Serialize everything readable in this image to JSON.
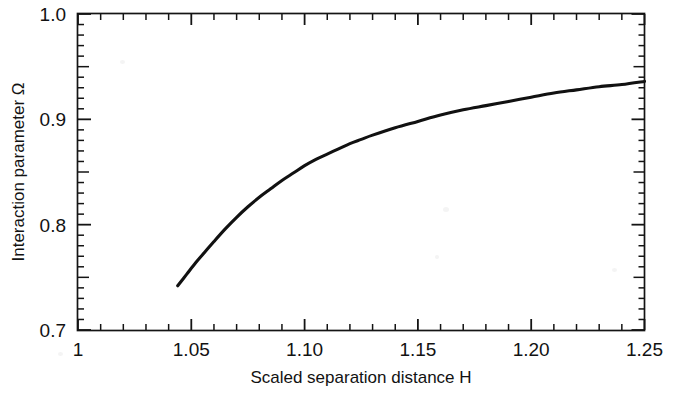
{
  "figure": {
    "background_color": "#ffffff",
    "line_color": "#111111"
  },
  "chart_data": {
    "type": "line",
    "title": "",
    "subtitle": "",
    "xlabel": "Scaled separation distance H",
    "ylabel": "Interaction parameter Ω",
    "xlim": [
      1.0,
      1.25
    ],
    "ylim": [
      0.7,
      1.0
    ],
    "grid": false,
    "legend": null,
    "legend_position": "none",
    "x_ticks_major": [
      1.0,
      1.05,
      1.1,
      1.15,
      1.2,
      1.25
    ],
    "x_tick_labels": [
      "1",
      "1.05",
      "1.10",
      "1.15",
      "1.20",
      "1.25"
    ],
    "x_minor_per_major": 5,
    "y_ticks_major": [
      0.7,
      0.8,
      0.9,
      1.0
    ],
    "y_tick_labels": [
      "0.7",
      "0.8",
      "0.9",
      "1.0"
    ],
    "y_minor_per_major": 10,
    "y_ticks_mid": [
      0.75,
      0.85,
      0.95
    ],
    "ticks_direction": "in",
    "series": [
      {
        "name": "Interaction parameter",
        "x": [
          1.044,
          1.048,
          1.052,
          1.056,
          1.06,
          1.065,
          1.07,
          1.075,
          1.08,
          1.085,
          1.09,
          1.095,
          1.1,
          1.105,
          1.11,
          1.115,
          1.12,
          1.125,
          1.13,
          1.14,
          1.15,
          1.16,
          1.17,
          1.18,
          1.19,
          1.2,
          1.21,
          1.22,
          1.23,
          1.24,
          1.25
        ],
        "values": [
          0.742,
          0.753,
          0.764,
          0.774,
          0.784,
          0.796,
          0.807,
          0.817,
          0.826,
          0.834,
          0.842,
          0.849,
          0.856,
          0.862,
          0.867,
          0.872,
          0.877,
          0.881,
          0.885,
          0.892,
          0.898,
          0.904,
          0.909,
          0.913,
          0.917,
          0.921,
          0.925,
          0.928,
          0.931,
          0.933,
          0.936
        ]
      }
    ]
  }
}
